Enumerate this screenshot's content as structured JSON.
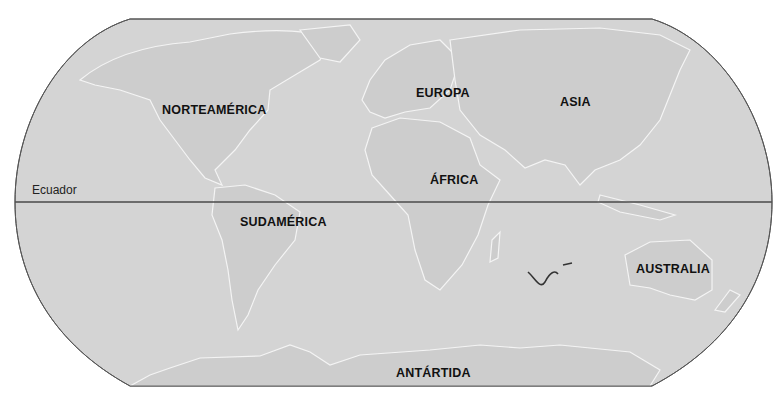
{
  "map": {
    "projection": "robinson",
    "colors": {
      "ocean": "#d3d3d3",
      "land": "#cfcfcf",
      "border": "#555555",
      "equator": "#4a4a4a",
      "coast_light": "#f2f2f2",
      "coast_dark": "#8a8a8a",
      "label": "#111111"
    },
    "equator": {
      "label": "Ecuador"
    },
    "continents": [
      {
        "id": "north-america",
        "label": "NORTEAMÉRICA"
      },
      {
        "id": "europe",
        "label": "EUROPA"
      },
      {
        "id": "asia",
        "label": "ASIA"
      },
      {
        "id": "africa",
        "label": "ÁFRICA"
      },
      {
        "id": "south-america",
        "label": "SUDAMÉRICA"
      },
      {
        "id": "australia",
        "label": "AUSTRALIA"
      },
      {
        "id": "antarctica",
        "label": "ANTÁRTIDA"
      }
    ]
  }
}
